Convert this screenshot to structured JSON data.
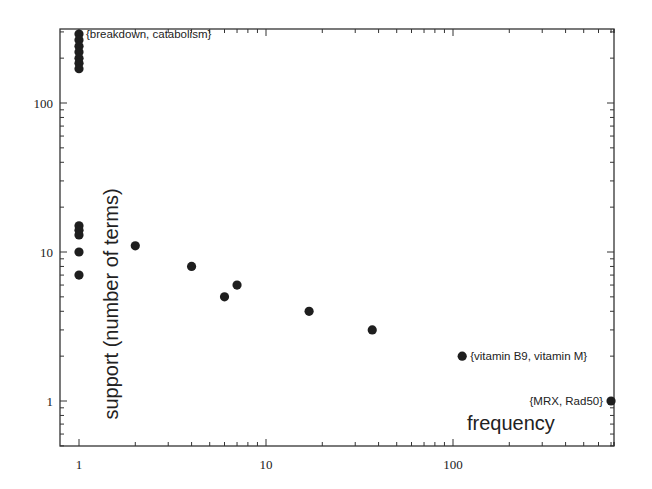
{
  "chart_data": {
    "type": "scatter",
    "title": "",
    "xlabel": "frequency",
    "ylabel": "support (number of terms)",
    "xscale": "log",
    "yscale": "log",
    "xlim": [
      0.85,
      700
    ],
    "ylim": [
      0.7,
      300
    ],
    "grid": false,
    "legend": null,
    "x_ticks": [
      {
        "value": 1,
        "label": "1"
      },
      {
        "value": 10,
        "label": "10"
      },
      {
        "value": 100,
        "label": "100"
      }
    ],
    "y_ticks": [
      {
        "value": 1,
        "label": "1"
      },
      {
        "value": 10,
        "label": "10"
      },
      {
        "value": 100,
        "label": "100"
      }
    ],
    "points": [
      {
        "x": 1,
        "y": 290
      },
      {
        "x": 1,
        "y": 265
      },
      {
        "x": 1,
        "y": 240
      },
      {
        "x": 1,
        "y": 220
      },
      {
        "x": 1,
        "y": 200
      },
      {
        "x": 1,
        "y": 185
      },
      {
        "x": 1,
        "y": 170
      },
      {
        "x": 1,
        "y": 15
      },
      {
        "x": 1,
        "y": 14
      },
      {
        "x": 1,
        "y": 13
      },
      {
        "x": 1,
        "y": 10
      },
      {
        "x": 1,
        "y": 7
      },
      {
        "x": 2,
        "y": 11
      },
      {
        "x": 4,
        "y": 8
      },
      {
        "x": 6,
        "y": 5
      },
      {
        "x": 7,
        "y": 6
      },
      {
        "x": 17,
        "y": 4
      },
      {
        "x": 37,
        "y": 3
      },
      {
        "x": 112,
        "y": 2
      },
      {
        "x": 700,
        "y": 1
      }
    ],
    "annotations": [
      {
        "text": "{breakdown, catabolism}",
        "x": 1,
        "y": 290
      },
      {
        "text": "{vitamin B9, vitamin M}",
        "x": 112,
        "y": 2
      },
      {
        "text": "{MRX, Rad50}",
        "x": 700,
        "y": 1
      }
    ]
  }
}
